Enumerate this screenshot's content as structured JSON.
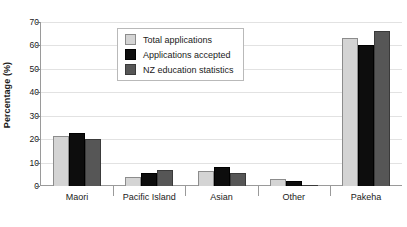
{
  "chart_data": {
    "type": "bar",
    "title": "",
    "xlabel": "",
    "ylabel": "Percentage (%)",
    "ylim": [
      0,
      70
    ],
    "ytick_step": 10,
    "yticks": [
      "0",
      "10",
      "20",
      "30",
      "40",
      "50",
      "60",
      "70"
    ],
    "grid": true,
    "legend_position": "top-center",
    "categories": [
      "Maori",
      "Pacific Island",
      "Asian",
      "Other",
      "Pakeha"
    ],
    "series": [
      {
        "name": "Total applications",
        "color": "#d4d4d4",
        "values": [
          21.5,
          4.0,
          6.5,
          2.8,
          63.0
        ]
      },
      {
        "name": "Applications accepted",
        "color": "#0d0d0d",
        "values": [
          22.5,
          5.5,
          8.0,
          2.2,
          60.0
        ]
      },
      {
        "name": "NZ education statistics",
        "color": "#565656",
        "values": [
          20.0,
          7.0,
          5.5,
          0.6,
          66.0
        ]
      }
    ]
  },
  "legend": {
    "items": [
      {
        "label": "Total applications"
      },
      {
        "label": "Applications accepted"
      },
      {
        "label": "NZ education statistics"
      }
    ]
  }
}
